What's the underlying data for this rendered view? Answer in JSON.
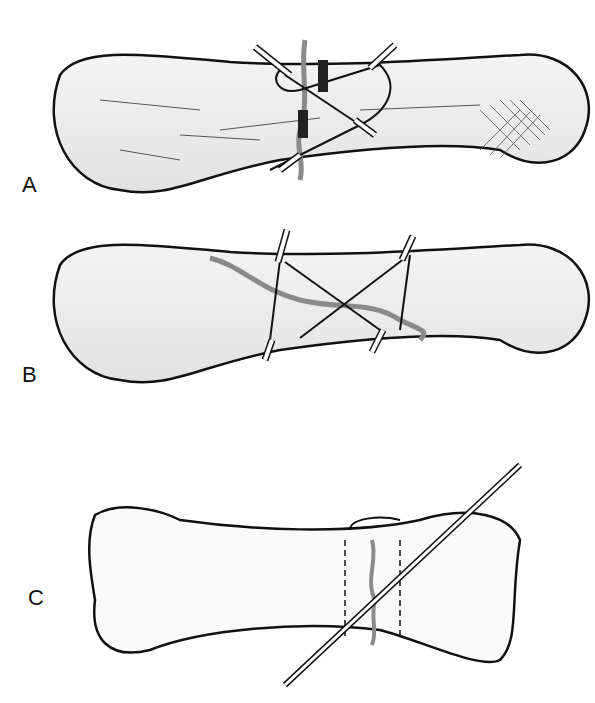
{
  "figure": {
    "panels": [
      {
        "label": "A",
        "description": "Bone with oblique fracture fixed by two pins and figure-of-eight cerclage wire"
      },
      {
        "label": "B",
        "description": "Bone with long oblique fracture fixed by two transverse pins and crossed figure-of-eight wires"
      },
      {
        "label": "C",
        "description": "Bone with fracture fixed by a long oblique Kirschner pin and cerclage band (dashed)"
      }
    ],
    "colors": {
      "bone_fill": "#ececec",
      "outline": "#111111",
      "fracture": "#8a8a8a",
      "pin": "#ffffff"
    }
  }
}
